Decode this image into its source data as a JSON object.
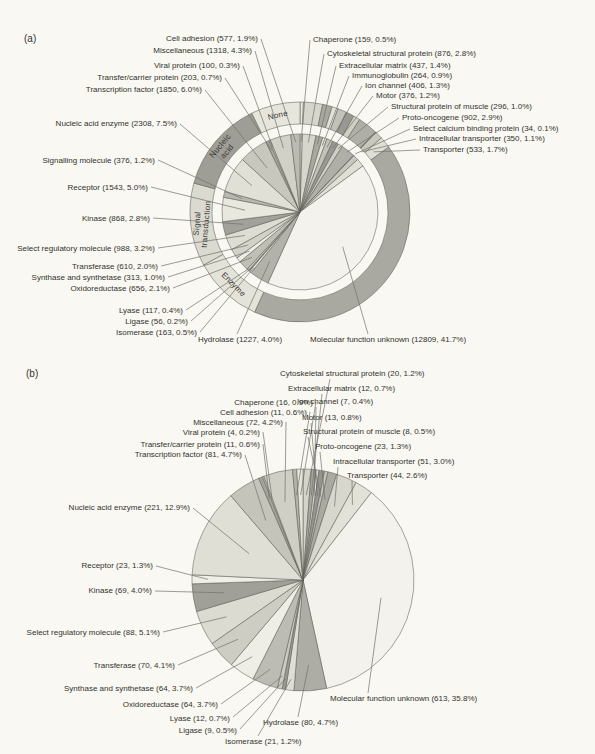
{
  "figure": {
    "background": "#f9f8f3",
    "text_color": "#33322d",
    "line_color": "#72716b",
    "outline_color": "#5e5d57"
  },
  "chart_data": [
    {
      "type": "pie",
      "panel_label": "(a)",
      "title": "",
      "cx": 300,
      "cy": 212,
      "r": 78,
      "slices": [
        {
          "label": "Chaperone",
          "count": 159,
          "pct": 0.5,
          "text": "Chaperone (159, 0.5%)",
          "color": "#e8e7dd",
          "lx": 313,
          "ly": 35,
          "align": "left",
          "ax": 310,
          "ay": 40,
          "er": 70
        },
        {
          "label": "Cytoskeletal structural protein",
          "count": 876,
          "pct": 2.8,
          "text": "Cytoskeletal structural protein (876, 2.8%)",
          "color": "#d7d6cc",
          "lx": 327,
          "ly": 49,
          "align": "left",
          "ax": 324,
          "ay": 54,
          "er": 70
        },
        {
          "label": "Extracellular matrix",
          "count": 437,
          "pct": 1.4,
          "text": "Extracellular matrix (437, 1.4%)",
          "color": "#a8a7a0",
          "lx": 339,
          "ly": 61,
          "align": "left",
          "ax": 336,
          "ay": 66,
          "er": 70
        },
        {
          "label": "Immunoglobulin",
          "count": 264,
          "pct": 0.9,
          "text": "Immunoglobulin (264, 0.9%)",
          "color": "#e3e2d8",
          "lx": 352,
          "ly": 71,
          "align": "left",
          "ax": 349,
          "ay": 76,
          "er": 70
        },
        {
          "label": "Ion channel",
          "count": 406,
          "pct": 1.3,
          "text": "Ion channel (406, 1.3%)",
          "color": "#c3c2b9",
          "lx": 365,
          "ly": 81,
          "align": "left",
          "ax": 362,
          "ay": 86,
          "er": 70
        },
        {
          "label": "Motor",
          "count": 376,
          "pct": 1.2,
          "text": "Motor (376, 1.2%)",
          "color": "#999892",
          "lx": 376,
          "ly": 91,
          "align": "left",
          "ax": 373,
          "ay": 96,
          "er": 72
        },
        {
          "label": "Structural protein of muscle",
          "count": 296,
          "pct": 1.0,
          "text": "Structural protein of muscle (296, 1.0%)",
          "color": "#d0cfc5",
          "lx": 391,
          "ly": 102,
          "align": "left",
          "ax": 388,
          "ay": 107,
          "er": 74
        },
        {
          "label": "Proto-oncogene",
          "count": 902,
          "pct": 2.9,
          "text": "Proto-oncogene (902, 2.9%)",
          "color": "#b0afa7",
          "lx": 402,
          "ly": 113,
          "align": "left",
          "ax": 399,
          "ay": 118,
          "er": 76
        },
        {
          "label": "Select calcium binding protein",
          "count": 34,
          "pct": 0.1,
          "text": "Select calcium binding protein (34, 0.1%)",
          "color": "#8f8e88",
          "lx": 413,
          "ly": 124,
          "align": "left",
          "ax": 410,
          "ay": 129,
          "er": 80
        },
        {
          "label": "Intracellular transporter",
          "count": 350,
          "pct": 1.1,
          "text": "Intracellular transporter (350, 1.1%)",
          "color": "#c9c8bf",
          "lx": 419,
          "ly": 134,
          "align": "left",
          "ax": 416,
          "ay": 139,
          "er": 86
        },
        {
          "label": "Transporter",
          "count": 533,
          "pct": 1.7,
          "text": "Transporter (533, 1.7%)",
          "color": "#e0dfd5",
          "lx": 423,
          "ly": 145,
          "align": "left",
          "ax": 420,
          "ay": 150,
          "er": 95
        },
        {
          "label": "Molecular function unknown",
          "count": 12809,
          "pct": 41.7,
          "text": "Molecular function unknown (12809, 41.7%)",
          "color": "#f3f2ec",
          "lx": 310,
          "ly": 335,
          "align": "left",
          "ax": 368,
          "ay": 334,
          "er": 55
        },
        {
          "label": "Hydrolase",
          "count": 1227,
          "pct": 4.0,
          "text": "Hydrolase (1227, 4.0%)",
          "color": "#b3b2aa",
          "lx": 198,
          "ly": 335,
          "align": "left",
          "ax": 237,
          "ay": 334,
          "er": 58
        },
        {
          "label": "Isomerase",
          "count": 163,
          "pct": 0.5,
          "text": "Isomerase (163, 0.5%)",
          "color": "#e5e4da",
          "lx": 197,
          "ly": 328,
          "align": "right",
          "ax": 200,
          "ay": 332,
          "er": 72
        },
        {
          "label": "Ligase",
          "count": 56,
          "pct": 0.2,
          "text": "Ligase (56, 0.2%)",
          "color": "#9c9b94",
          "lx": 188,
          "ly": 317,
          "align": "right",
          "ax": 191,
          "ay": 321,
          "er": 74
        },
        {
          "label": "Lyase",
          "count": 117,
          "pct": 0.4,
          "text": "Lyase (117, 0.4%)",
          "color": "#cfcec4",
          "lx": 183,
          "ly": 306,
          "align": "right",
          "ax": 186,
          "ay": 310,
          "er": 76
        },
        {
          "label": "Oxidoreductase",
          "count": 656,
          "pct": 2.1,
          "text": "Oxidoreductase (656, 2.1%)",
          "color": "#c0bfb6",
          "lx": 170,
          "ly": 284,
          "align": "right",
          "ax": 173,
          "ay": 288,
          "er": 66
        },
        {
          "label": "Synthase and synthetase",
          "count": 313,
          "pct": 1.0,
          "text": "Synthase and synthetase (313, 1.0%)",
          "color": "#eeede5",
          "lx": 165,
          "ly": 273,
          "align": "right",
          "ax": 168,
          "ay": 277,
          "er": 64
        },
        {
          "label": "Transferase",
          "count": 610,
          "pct": 2.0,
          "text": "Transferase (610, 2.0%)",
          "color": "#d3d2c8",
          "lx": 158,
          "ly": 262,
          "align": "right",
          "ax": 161,
          "ay": 266,
          "er": 62
        },
        {
          "label": "Select regulatory molecule",
          "count": 988,
          "pct": 3.2,
          "text": "Select regulatory molecule (988, 3.2%)",
          "color": "#deddd3",
          "lx": 155,
          "ly": 244,
          "align": "right",
          "ax": 158,
          "ay": 248,
          "er": 60
        },
        {
          "label": "Kinase",
          "count": 868,
          "pct": 2.8,
          "text": "Kinase (868, 2.8%)",
          "color": "#a2a19a",
          "lx": 150,
          "ly": 214,
          "align": "right",
          "ax": 153,
          "ay": 218,
          "er": 58
        },
        {
          "label": "Receptor",
          "count": 1543,
          "pct": 5.0,
          "text": "Receptor (1543, 5.0%)",
          "color": "#e9e8de",
          "lx": 148,
          "ly": 183,
          "align": "right",
          "ax": 151,
          "ay": 187,
          "er": 55
        },
        {
          "label": "Signalling molecule",
          "count": 376,
          "pct": 1.2,
          "text": "Signalling molecule (376, 1.2%)",
          "color": "#b9b8b0",
          "lx": 155,
          "ly": 156,
          "align": "right",
          "ax": 158,
          "ay": 160,
          "er": 60
        },
        {
          "label": "Nucleic acid enzyme",
          "count": 2308,
          "pct": 7.5,
          "text": "Nucleic acid enzyme (2308, 7.5%)",
          "color": "#e1e0d6",
          "lx": 177,
          "ly": 119,
          "align": "right",
          "ax": 180,
          "ay": 124,
          "er": 55
        },
        {
          "label": "Transcription factor",
          "count": 1850,
          "pct": 6.0,
          "text": "Transcription factor (1850, 6.0%)",
          "color": "#c8c7be",
          "lx": 202,
          "ly": 85,
          "align": "right",
          "ax": 205,
          "ay": 90,
          "er": 55
        },
        {
          "label": "Transfer/carrier protein",
          "count": 203,
          "pct": 0.7,
          "text": "Transfer/carrier protein (203, 0.7%)",
          "color": "#a5a49d",
          "lx": 222,
          "ly": 73,
          "align": "right",
          "ax": 225,
          "ay": 78,
          "er": 68
        },
        {
          "label": "Viral protein",
          "count": 100,
          "pct": 0.3,
          "text": "Viral protein (100, 0.3%)",
          "color": "#dad9cf",
          "lx": 240,
          "ly": 61,
          "align": "right",
          "ax": 243,
          "ay": 66,
          "er": 70
        },
        {
          "label": "Miscellaneous",
          "count": 1318,
          "pct": 4.3,
          "text": "Miscellaneous (1318, 4.3%)",
          "color": "#d2d1c7",
          "lx": 252,
          "ly": 46,
          "align": "right",
          "ax": 255,
          "ay": 51,
          "er": 66
        },
        {
          "label": "Cell adhesion",
          "count": 577,
          "pct": 1.9,
          "text": "Cell adhesion (577, 1.9%)",
          "color": "#bcbbb3",
          "lx": 258,
          "ly": 34,
          "align": "right",
          "ax": 261,
          "ay": 39,
          "er": 70
        }
      ],
      "ring": {
        "inner": 88,
        "outer": 110,
        "segments": [
          {
            "span": [
              0,
              10
            ],
            "mode": "each"
          },
          {
            "span": [
              11,
              11
            ],
            "color": "#a9a8a1",
            "group": "Molecular function unknown"
          },
          {
            "span": [
              12,
              18
            ],
            "color": "#e4e3d9",
            "group": "Enzyme"
          },
          {
            "span": [
              19,
              22
            ],
            "color": "#dbdad0",
            "group": "Signal transduction"
          },
          {
            "span": [
              23,
              24
            ],
            "color": "#9e9d96",
            "group": "Nucleic acid"
          },
          {
            "span": [
              25,
              28
            ],
            "color": "#e7e6dc",
            "group": "None"
          }
        ],
        "labels": [
          {
            "lines": [
              "None"
            ],
            "x": 278,
            "y": 116,
            "rot": -13
          },
          {
            "lines": [
              "Nucleic",
              "acid"
            ],
            "x": 224,
            "y": 149,
            "rot": -50
          },
          {
            "lines": [
              "Signal",
              "transduction"
            ],
            "x": 202,
            "y": 224,
            "rot": -85
          },
          {
            "lines": [
              "Enzyme"
            ],
            "x": 233,
            "y": 285,
            "rot": 45
          }
        ]
      }
    },
    {
      "type": "pie",
      "panel_label": "(b)",
      "title": "",
      "cx": 303,
      "cy": 580,
      "r": 111,
      "slices": [
        {
          "label": "Cytoskeletal structural protein",
          "count": 20,
          "pct": 1.2,
          "text": "Cytoskeletal structural protein (20, 1.2%)",
          "color": "#d4d3c9",
          "lx": 280,
          "ly": 369,
          "align": "left",
          "ax": 330,
          "ay": 379,
          "er": 85
        },
        {
          "label": "Extracellular matrix",
          "count": 12,
          "pct": 0.7,
          "text": "Extracellular matrix (12, 0.7%)",
          "color": "#a6a59e",
          "lx": 288,
          "ly": 384,
          "align": "left",
          "ax": 322,
          "ay": 394,
          "er": 85
        },
        {
          "label": "Ion channel",
          "count": 7,
          "pct": 0.4,
          "text": "Ion channel (7, 0.4%)",
          "color": "#dcdbd1",
          "lx": 297,
          "ly": 397,
          "align": "left",
          "ax": 316,
          "ay": 407,
          "er": 85
        },
        {
          "label": "Motor",
          "count": 13,
          "pct": 0.8,
          "text": "Motor (13, 0.8%)",
          "color": "#96958f",
          "lx": 302,
          "ly": 413,
          "align": "left",
          "ax": 311,
          "ay": 423,
          "er": 85
        },
        {
          "label": "Structural protein of muscle",
          "count": 8,
          "pct": 0.5,
          "text": "Structural protein of muscle (8, 0.5%)",
          "color": "#c6c5bc",
          "lx": 303,
          "ly": 427,
          "align": "left",
          "ax": 308,
          "ay": 437,
          "er": 85
        },
        {
          "label": "Proto-oncogene",
          "count": 23,
          "pct": 1.3,
          "text": "Proto-oncogene (23, 1.3%)",
          "color": "#abaaa2",
          "lx": 315,
          "ly": 442,
          "align": "left",
          "ax": 320,
          "ay": 452,
          "er": 83
        },
        {
          "label": "Intracellular transporter",
          "count": 51,
          "pct": 3.0,
          "text": "Intracellular transporter (51, 3.0%)",
          "color": "#d8d7cd",
          "lx": 333,
          "ly": 457,
          "align": "left",
          "ax": 338,
          "ay": 467,
          "er": 80
        },
        {
          "label": "Transporter",
          "count": 44,
          "pct": 2.6,
          "text": "Transporter (44, 2.6%)",
          "color": "#e3e2d8",
          "lx": 347,
          "ly": 471,
          "align": "left",
          "ax": 352,
          "ay": 481,
          "er": 90
        },
        {
          "label": "Molecular function unknown",
          "count": 613,
          "pct": 35.8,
          "text": "Molecular function unknown (613, 35.8%)",
          "color": "#f3f2ec",
          "lx": 330,
          "ly": 694,
          "align": "left",
          "ax": 368,
          "ay": 693,
          "er": 80
        },
        {
          "label": "Hydrolase",
          "count": 80,
          "pct": 4.7,
          "text": "Hydrolase (80, 4.7%)",
          "color": "#aeada5",
          "lx": 263,
          "ly": 718,
          "align": "left",
          "ax": 298,
          "ay": 717,
          "er": 85
        },
        {
          "label": "Isomerase",
          "count": 21,
          "pct": 1.2,
          "text": "Isomerase (21, 1.2%)",
          "color": "#dfded4",
          "lx": 225,
          "ly": 737,
          "align": "left",
          "ax": 258,
          "ay": 736,
          "er": 100
        },
        {
          "label": "Ligase",
          "count": 9,
          "pct": 0.5,
          "text": "Ligase (9, 0.5%)",
          "color": "#9a9993",
          "lx": 237,
          "ly": 726,
          "align": "right",
          "ax": 240,
          "ay": 729,
          "er": 100
        },
        {
          "label": "Lyase",
          "count": 12,
          "pct": 0.7,
          "text": "Lyase (12, 0.7%)",
          "color": "#cbcac1",
          "lx": 230,
          "ly": 714,
          "align": "right",
          "ax": 233,
          "ay": 717,
          "er": 98
        },
        {
          "label": "Oxidoreductase",
          "count": 64,
          "pct": 3.7,
          "text": "Oxidoreductase (64, 3.7%)",
          "color": "#bdbcb4",
          "lx": 218,
          "ly": 700,
          "align": "right",
          "ax": 221,
          "ay": 704,
          "er": 95
        },
        {
          "label": "Synthase and synthetase",
          "count": 64,
          "pct": 3.7,
          "text": "Synthase and synthetase (64, 3.7%)",
          "color": "#efeee6",
          "lx": 193,
          "ly": 684,
          "align": "right",
          "ax": 196,
          "ay": 688,
          "er": 92
        },
        {
          "label": "Transferase",
          "count": 70,
          "pct": 4.1,
          "text": "Transferase (70, 4.1%)",
          "color": "#cecdc3",
          "lx": 175,
          "ly": 661,
          "align": "right",
          "ax": 178,
          "ay": 665,
          "er": 88
        },
        {
          "label": "Select regulatory molecule",
          "count": 88,
          "pct": 5.1,
          "text": "Select regulatory molecule (88, 5.1%)",
          "color": "#dcdbd1",
          "lx": 160,
          "ly": 628,
          "align": "right",
          "ax": 163,
          "ay": 632,
          "er": 85
        },
        {
          "label": "Kinase",
          "count": 69,
          "pct": 4.0,
          "text": "Kinase (69, 4.0%)",
          "color": "#a09f98",
          "lx": 152,
          "ly": 586,
          "align": "right",
          "ax": 155,
          "ay": 591,
          "er": 80
        },
        {
          "label": "Receptor",
          "count": 23,
          "pct": 1.3,
          "text": "Receptor (23, 1.3%)",
          "color": "#f0efe7",
          "lx": 153,
          "ly": 561,
          "align": "right",
          "ax": 156,
          "ay": 566,
          "er": 95
        },
        {
          "label": "Nucleic acid enzyme",
          "count": 221,
          "pct": 12.9,
          "text": "Nucleic acid enzyme (221, 12.9%)",
          "color": "#e0dfd5",
          "lx": 190,
          "ly": 503,
          "align": "right",
          "ax": 193,
          "ay": 508,
          "er": 60
        },
        {
          "label": "Transcription factor",
          "count": 81,
          "pct": 4.7,
          "text": "Transcription factor (81, 4.7%)",
          "color": "#c5c4bb",
          "lx": 242,
          "ly": 450,
          "align": "right",
          "ax": 245,
          "ay": 455,
          "er": 70
        },
        {
          "label": "Transfer/carrier protein",
          "count": 11,
          "pct": 0.6,
          "text": "Transfer/carrier protein (11, 0.6%)",
          "color": "#a3a29b",
          "lx": 260,
          "ly": 440,
          "align": "right",
          "ax": 263,
          "ay": 444,
          "er": 88
        },
        {
          "label": "Viral protein",
          "count": 4,
          "pct": 0.2,
          "text": "Viral protein (4, 0.2%)",
          "color": "#d7d6cc",
          "lx": 260,
          "ly": 428,
          "align": "right",
          "ax": 263,
          "ay": 432,
          "er": 86
        },
        {
          "label": "Miscellaneous",
          "count": 72,
          "pct": 4.2,
          "text": "Miscellaneous (72, 4.2%)",
          "color": "#d0cfc6",
          "lx": 283,
          "ly": 418,
          "align": "right",
          "ax": 286,
          "ay": 422,
          "er": 80
        },
        {
          "label": "Cell adhesion",
          "count": 11,
          "pct": 0.6,
          "text": "Cell adhesion (11, 0.6%)",
          "color": "#b5b4ac",
          "lx": 307,
          "ly": 408,
          "align": "right",
          "ax": 310,
          "ay": 412,
          "er": 85
        },
        {
          "label": "Chaperone",
          "count": 16,
          "pct": 0.9,
          "text": "Chaperone (16, 0.9%)",
          "color": "#e6e5db",
          "lx": 313,
          "ly": 398,
          "align": "right",
          "ax": 316,
          "ay": 402,
          "er": 85
        }
      ]
    }
  ]
}
